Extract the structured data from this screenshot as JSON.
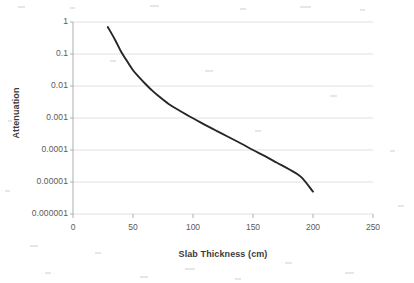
{
  "chart_data": {
    "type": "line",
    "title": "",
    "xlabel": "Slab Thickness (cm)",
    "ylabel": "Attenuation",
    "xlim": [
      0,
      250
    ],
    "ylim": [
      1e-06,
      1
    ],
    "yscale": "log",
    "xscale": "linear",
    "grid": "horizontal",
    "legend": "none",
    "xticks": [
      "0",
      "50",
      "100",
      "150",
      "200",
      "250"
    ],
    "xtick_values": [
      0,
      50,
      100,
      150,
      200,
      250
    ],
    "yticks": [
      "0.000001",
      "0.00001",
      "0.0001",
      "0.001",
      "0.01",
      "0.1",
      "1"
    ],
    "ytick_values": [
      1e-06,
      1e-05,
      0.0001,
      0.001,
      0.01,
      0.1,
      1
    ],
    "series": [
      {
        "name": "Attenuation",
        "color": "#262626",
        "x": [
          29,
          35,
          40,
          45,
          50,
          55,
          60,
          65,
          70,
          80,
          90,
          100,
          110,
          120,
          130,
          140,
          150,
          160,
          170,
          180,
          190,
          200
        ],
        "y": [
          0.7,
          0.28,
          0.12,
          0.06,
          0.031,
          0.019,
          0.012,
          0.0078,
          0.0053,
          0.0027,
          0.0016,
          0.00098,
          0.00061,
          0.00039,
          0.00025,
          0.00016,
          0.0001,
          6.4e-05,
          4e-05,
          2.5e-05,
          1.45e-05,
          5e-06
        ]
      }
    ]
  },
  "axis": {
    "x_title": "Slab Thickness (cm)",
    "y_title": "Attenuation"
  }
}
